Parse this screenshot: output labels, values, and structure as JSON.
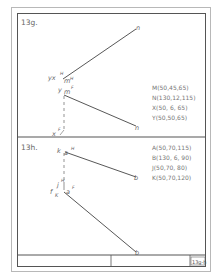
{
  "panels": [
    {
      "title": "13g.",
      "coordinates": [
        "M(50,45,65)",
        "N(130,12,115)",
        "X(50, 6, 65)",
        "Y(50,50,65)"
      ],
      "labels": {
        "yx_h": "yx",
        "h_sup1": "H",
        "m_h": "m",
        "h_sup2": "H",
        "n_top": "n",
        "y_f": "y",
        "m_f": "m",
        "f_sup1": "F",
        "x_f": "x",
        "f_sup2": "F",
        "n_bottom": "n"
      }
    },
    {
      "title": "13h.",
      "coordinates": [
        "A(50,70,115)",
        "B(130, 6, 90)",
        "J(50,70, 80)",
        "K(50,70,120)"
      ],
      "labels": {
        "k_h": "k",
        "a_h": "a",
        "h_sup1": "H",
        "b_top": "b",
        "j_h": "j",
        "h_sup2": "H",
        "f_k": "f",
        "k_f": "K",
        "a_f": "a",
        "f_sup": "F",
        "b_bottom": "b"
      }
    }
  ],
  "title_block": {
    "sheet_number": "13g-h"
  },
  "colors": {
    "line": "#444444",
    "text": "#666666",
    "frame": "#555555"
  }
}
